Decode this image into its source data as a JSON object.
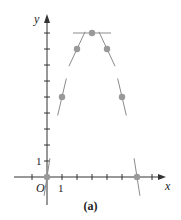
{
  "chart_data": {
    "type": "scatter",
    "title": "",
    "caption": "(a)",
    "xlabel": "x",
    "ylabel": "y",
    "origin_label": "O",
    "x_tick_label": "1",
    "y_tick_label": "1",
    "xlim": [
      -1,
      7.5
    ],
    "ylim": [
      0,
      10
    ],
    "x_ticks": [
      -1,
      1,
      2,
      3,
      4,
      5,
      6,
      7
    ],
    "y_ticks": [
      1,
      2,
      3,
      4,
      5,
      6,
      7,
      8,
      9
    ],
    "grid": false,
    "legend": null,
    "points": [
      {
        "x": 0,
        "y": 0,
        "slope": 6
      },
      {
        "x": 1,
        "y": 5,
        "slope": 4
      },
      {
        "x": 2,
        "y": 8,
        "slope": 2
      },
      {
        "x": 3,
        "y": 9,
        "slope": 0
      },
      {
        "x": 4,
        "y": 8,
        "slope": -2
      },
      {
        "x": 5,
        "y": 5,
        "slope": -4
      },
      {
        "x": 6,
        "y": 0,
        "slope": -6
      }
    ],
    "annotations": "Short tangent line segments drawn through each sampled point of y = 9 - (x - 3)^2"
  },
  "colors": {
    "axis": "#333333",
    "point": "#999999",
    "tangent": "#8c8c8c"
  }
}
